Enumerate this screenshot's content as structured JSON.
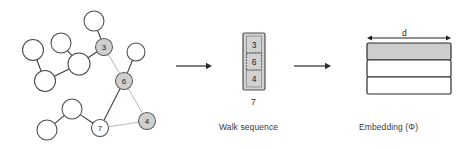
{
  "figure": {
    "width": 468,
    "height": 149,
    "background": "#ffffff"
  },
  "colors": {
    "visited_node_fill": "#cfcfcf",
    "unvisited_node_fill": "#ffffff",
    "node_stroke": "#4a4a4a",
    "edge": "#3d3d3d",
    "edge_light": "#b9b9b9",
    "sequence_box_fill": "#d2d2d2",
    "embedding_filled": "#cdcdcd",
    "arrow": "#2b2b2b"
  },
  "graph": {
    "name": "input-graph",
    "nodes": [
      {
        "id": "n1",
        "label": "",
        "cx": 33,
        "cy": 50,
        "r": 10.5,
        "visited": false
      },
      {
        "id": "n2",
        "label": "",
        "cx": 45,
        "cy": 81,
        "r": 10.5,
        "visited": false
      },
      {
        "id": "n3",
        "label": "",
        "cx": 61,
        "cy": 43,
        "r": 10.0,
        "visited": false
      },
      {
        "id": "n4",
        "label": "",
        "cx": 79,
        "cy": 64,
        "r": 11.0,
        "visited": false
      },
      {
        "id": "n5",
        "label": "",
        "cx": 94,
        "cy": 21,
        "r": 10.0,
        "visited": false
      },
      {
        "id": "n6",
        "label": "3",
        "cx": 104,
        "cy": 47,
        "r": 8.5,
        "visited": true
      },
      {
        "id": "n7",
        "label": "6",
        "cx": 124,
        "cy": 81,
        "r": 8.5,
        "visited": true
      },
      {
        "id": "n8",
        "label": "",
        "cx": 136,
        "cy": 52,
        "r": 9.0,
        "visited": false
      },
      {
        "id": "n9",
        "label": "4",
        "cx": 147,
        "cy": 121,
        "r": 8.5,
        "visited": true
      },
      {
        "id": "n10",
        "label": "7",
        "cx": 100,
        "cy": 128,
        "r": 8.5,
        "visited": false
      },
      {
        "id": "n11",
        "label": "",
        "cx": 72,
        "cy": 109,
        "r": 10.0,
        "visited": false
      },
      {
        "id": "n12",
        "label": "",
        "cx": 47,
        "cy": 130,
        "r": 10.0,
        "visited": false
      }
    ],
    "edges": [
      {
        "from": "n1",
        "to": "n2",
        "light": false
      },
      {
        "from": "n2",
        "to": "n4",
        "light": false
      },
      {
        "from": "n3",
        "to": "n4",
        "light": false
      },
      {
        "from": "n4",
        "to": "n6",
        "light": false
      },
      {
        "from": "n6",
        "to": "n5",
        "light": false
      },
      {
        "from": "n6",
        "to": "n7",
        "light": true
      },
      {
        "from": "n7",
        "to": "n8",
        "light": false
      },
      {
        "from": "n7",
        "to": "n10",
        "light": false
      },
      {
        "from": "n7",
        "to": "n9",
        "light": true
      },
      {
        "from": "n10",
        "to": "n9",
        "light": true
      },
      {
        "from": "n10",
        "to": "n11",
        "light": false
      },
      {
        "from": "n11",
        "to": "n12",
        "light": false
      }
    ]
  },
  "arrows": [
    {
      "name": "arrow-graph-to-walk",
      "x1": 176,
      "y1": 66,
      "x2": 212,
      "y2": 66
    },
    {
      "name": "arrow-walk-to-embedding",
      "x1": 294,
      "y1": 66,
      "x2": 331,
      "y2": 66
    }
  ],
  "walk_sequence": {
    "caption": "Walk sequence",
    "items": [
      "3",
      "6",
      "4"
    ],
    "highlight_index": 1,
    "tail_label": "7"
  },
  "embedding": {
    "caption": "Embedding (Φ)",
    "dimension_label": "d",
    "rows": [
      {
        "filled": true
      },
      {
        "filled": false
      },
      {
        "filled": false
      }
    ]
  }
}
